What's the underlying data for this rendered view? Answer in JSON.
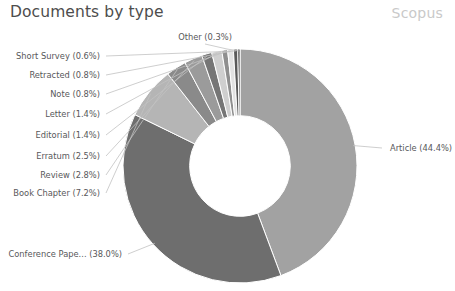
{
  "header": {
    "title": "Documents by type",
    "watermark": "Scopus"
  },
  "chart_data": {
    "type": "pie",
    "variant": "donut",
    "title": "Documents by type",
    "subtitle": "",
    "xlabel": "",
    "ylabel": "",
    "units": "percent",
    "legend_position": "none",
    "grid": false,
    "labels_show_percent": true,
    "donut_inner_ratio": 0.43,
    "start_angle_deg": 0,
    "direction": "clockwise",
    "categories": [
      "Article",
      "Conference Pape...",
      "Book Chapter",
      "Review",
      "Erratum",
      "Editorial",
      "Letter",
      "Note",
      "Retracted",
      "Short Survey",
      "Other"
    ],
    "values": [
      44.4,
      38.0,
      7.2,
      2.8,
      2.5,
      1.4,
      1.4,
      0.8,
      0.8,
      0.6,
      0.3
    ],
    "colors": [
      "#a2a2a2",
      "#6e6e6e",
      "#b5b5b5",
      "#8a8a8a",
      "#9b9b9b",
      "#767676",
      "#cfcfcf",
      "#8f8f8f",
      "#e2e2e2",
      "#5a5a5a",
      "#2f2f2f"
    ],
    "slices": [
      {
        "label": "Article (44.4%)",
        "name": "Article",
        "value": 44.4,
        "color": "#a2a2a2"
      },
      {
        "label": "Conference Pape... (38.0%)",
        "name": "Conference Pape...",
        "value": 38.0,
        "color": "#6e6e6e"
      },
      {
        "label": "Book Chapter (7.2%)",
        "name": "Book Chapter",
        "value": 7.2,
        "color": "#b5b5b5"
      },
      {
        "label": "Review (2.8%)",
        "name": "Review",
        "value": 2.8,
        "color": "#8a8a8a"
      },
      {
        "label": "Erratum (2.5%)",
        "name": "Erratum",
        "value": 2.5,
        "color": "#9b9b9b"
      },
      {
        "label": "Editorial (1.4%)",
        "name": "Editorial",
        "value": 1.4,
        "color": "#767676"
      },
      {
        "label": "Letter (1.4%)",
        "name": "Letter",
        "value": 1.4,
        "color": "#cfcfcf"
      },
      {
        "label": "Note (0.8%)",
        "name": "Note",
        "value": 0.8,
        "color": "#8f8f8f"
      },
      {
        "label": "Retracted (0.8%)",
        "name": "Retracted",
        "value": 0.8,
        "color": "#e2e2e2"
      },
      {
        "label": "Short Survey (0.6%)",
        "name": "Short Survey",
        "value": 0.6,
        "color": "#5a5a5a"
      },
      {
        "label": "Other (0.3%)",
        "name": "Other",
        "value": 0.3,
        "color": "#2f2f2f"
      }
    ]
  }
}
